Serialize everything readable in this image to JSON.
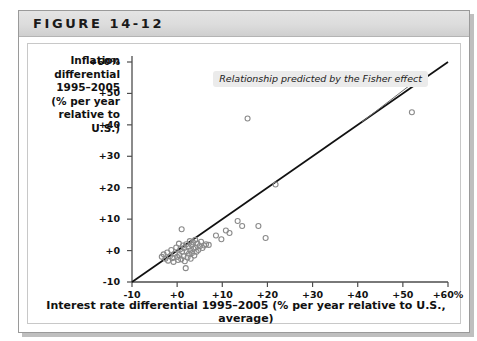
{
  "figure": {
    "label": "FIGURE 14-12"
  },
  "chart_data": {
    "type": "scatter",
    "title": "FIGURE 14-12",
    "xlabel": "Interest rate differential 1995–2005 (% per year relative to U.S., average)",
    "ylabel": "Inflation differential 1995–2005 (% per year relative to U.S.)",
    "xlim": [
      -10,
      60
    ],
    "ylim": [
      -10,
      60
    ],
    "grid": false,
    "legend": null,
    "xticks": [
      "-10",
      "+0",
      "+10",
      "+20",
      "+30",
      "+40",
      "+50",
      "+60%"
    ],
    "xtick_values": [
      -10,
      0,
      10,
      20,
      30,
      40,
      50,
      60
    ],
    "yticks": [
      "-10",
      "+0",
      "+10",
      "+20",
      "+30",
      "+40",
      "+50",
      "+60%"
    ],
    "ytick_values": [
      -10,
      0,
      10,
      20,
      30,
      40,
      50,
      60
    ],
    "marker": "open-circle",
    "marker_color": "#8a8a8a",
    "line_color": "#111111",
    "annotations": [
      {
        "text": "Relationship predicted by the Fisher effect",
        "x": 8,
        "y": 55,
        "leader_to_x": 41,
        "leader_to_y": 41
      }
    ],
    "series": [
      {
        "name": "45-degree line (Fisher effect)",
        "type": "line",
        "points": [
          [
            -10,
            -10
          ],
          [
            60,
            60
          ]
        ]
      },
      {
        "name": "Countries",
        "type": "scatter",
        "points": [
          [
            -3.4,
            -2.0
          ],
          [
            -3.0,
            -1.2
          ],
          [
            -2.6,
            -2.6
          ],
          [
            -2.2,
            -0.6
          ],
          [
            -2.0,
            -3.2
          ],
          [
            -1.6,
            -1.8
          ],
          [
            -1.3,
            0.2
          ],
          [
            -1.0,
            -2.4
          ],
          [
            -0.8,
            -3.6
          ],
          [
            -0.5,
            -1.0
          ],
          [
            -0.2,
            1.0
          ],
          [
            0.0,
            -2.0
          ],
          [
            0.2,
            -3.0
          ],
          [
            0.4,
            2.2
          ],
          [
            0.5,
            -1.4
          ],
          [
            0.7,
            0.4
          ],
          [
            0.9,
            -2.8
          ],
          [
            1.0,
            6.8
          ],
          [
            1.1,
            -0.4
          ],
          [
            1.3,
            1.6
          ],
          [
            1.4,
            -1.8
          ],
          [
            1.6,
            0.8
          ],
          [
            1.7,
            -3.4
          ],
          [
            1.9,
            -5.6
          ],
          [
            2.0,
            2.0
          ],
          [
            2.1,
            -0.2
          ],
          [
            2.3,
            -2.2
          ],
          [
            2.5,
            1.2
          ],
          [
            2.6,
            -1.0
          ],
          [
            2.8,
            3.0
          ],
          [
            2.9,
            0.0
          ],
          [
            3.0,
            -2.6
          ],
          [
            3.2,
            1.8
          ],
          [
            3.3,
            -0.8
          ],
          [
            3.5,
            2.6
          ],
          [
            3.6,
            0.6
          ],
          [
            3.8,
            -1.6
          ],
          [
            4.0,
            3.4
          ],
          [
            4.1,
            1.0
          ],
          [
            4.3,
            -0.4
          ],
          [
            4.5,
            2.2
          ],
          [
            4.7,
            0.2
          ],
          [
            5.0,
            1.4
          ],
          [
            5.3,
            2.8
          ],
          [
            5.6,
            0.8
          ],
          [
            6.0,
            1.6
          ],
          [
            6.4,
            2.0
          ],
          [
            7.0,
            1.8
          ],
          [
            8.6,
            4.8
          ],
          [
            9.8,
            3.6
          ],
          [
            10.8,
            6.4
          ],
          [
            11.6,
            5.6
          ],
          [
            13.4,
            9.4
          ],
          [
            14.4,
            7.8
          ],
          [
            15.6,
            42.0
          ],
          [
            18.0,
            7.8
          ],
          [
            19.6,
            4.0
          ],
          [
            21.8,
            21.0
          ],
          [
            52.0,
            44.0
          ]
        ]
      }
    ]
  }
}
